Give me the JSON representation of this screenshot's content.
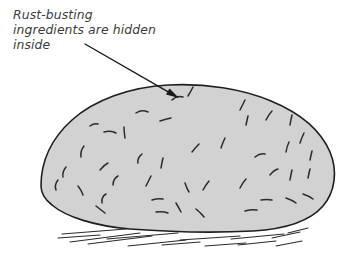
{
  "illustration": {
    "title": "Rock cross-section annotation illustration",
    "background_color": "#ffffff"
  },
  "annotation": {
    "text": "Rust-busting\ningredients are hidden\ninside",
    "lines": [
      "Rust-busting",
      "ingredients are hidden",
      "inside"
    ],
    "color": "#3b3b3b",
    "style": "italic"
  },
  "arrow": {
    "name": "annotation-arrow",
    "start": {
      "x": 85,
      "y": 44
    },
    "end": {
      "x": 179,
      "y": 98
    },
    "color": "#1a1a1a",
    "stroke_width": 1.4,
    "head_length": 13,
    "head_width": 7
  },
  "rock": {
    "name": "rock-boulder",
    "fill_color": "#d2d2d2",
    "stroke_color": "#1f1f1f",
    "stroke_width": 1.6,
    "outline_path": "M 41 186 C 41 160, 52 138, 72 120 C 94 100, 130 87, 168 85 C 205 83, 243 89, 271 101 C 300 113, 321 131, 330 152 C 338 171, 335 192, 323 206 C 310 221, 287 229, 253 231 C 216 233, 170 232, 130 229 C 95 226, 66 217, 52 205 C 43 198, 41 192, 41 186 Z"
  },
  "speckles": {
    "name": "rock-texture-marks",
    "color": "#2b2b2b",
    "stroke_width": 1.5,
    "marks": [
      "M 136 113 q 6 -4 12 -1",
      "M 172 100 q 5 -5 11 -3",
      "M 188 96 q 3 -5 5 -9",
      "M 160 121 q 6 -2 11 -3",
      "M 240 110 q 3 -6 5 -10",
      "M 246 125 q 1 -5 2 -9",
      "M 266 120 q 3 -6 6 -9",
      "M 290 125 q 1 -6 2 -10",
      "M 90 126 q 4 -3 8 -2",
      "M 104 132 q 7 -2 12 1",
      "M 125 138 q -1 -6 -1 -11",
      "M 84 146 q -4 5 -3 11",
      "M 300 143 q 2 -6 4 -10",
      "M 286 152 q 1 -6 3 -10",
      "M 142 154 q -5 4 -4 9",
      "M 192 152 q 4 -5 7 -8",
      "M 221 148 q 2 -6 4 -10",
      "M 255 157 q 5 -4 10 -3",
      "M 310 160 q 1 -5 2 -9",
      "M 161 168 q 1 -6 2 -10",
      "M 66 167 q -4 5 -3 10",
      "M 100 170 q 4 -5 8 -7",
      "M 118 176 q -5 3 -5 9",
      "M 270 175 q 4 -5 8 -6",
      "M 290 180 q 1 -6 2 -10",
      "M 308 178 q 1 -5 2 -9",
      "M 58 180 q -4 5 -2 10",
      "M 78 186 q 4 5 5 9",
      "M 146 186 q 3 -6 5 -10",
      "M 185 183 q 2 6 4 9",
      "M 209 181 q -4 5 -6 9",
      "M 240 188 q 3 -6 6 -9",
      "M 106 194 q -5 3 -4 9",
      "M 96 206 q 5 4 9 7",
      "M 152 200 q 6 -2 11 -1",
      "M 176 203 q 3 5 5 9",
      "M 261 200 q 6 -1 11 0",
      "M 286 198 q 6 2 10 5",
      "M 303 194 q 6 2 10 5",
      "M 156 212 q 7 -1 12 1",
      "M 196 209 q 5 4 8 8",
      "M 245 211 q 7 -2 12 -1"
    ]
  },
  "ground": {
    "name": "ground-hatch-lines",
    "color": "#2b2b2b",
    "stroke_width": 1.1,
    "lines": [
      "M 62 234 L 126 229",
      "M 70 242 L 140 233",
      "M 88 244 L 152 236",
      "M 107 239 L 178 233",
      "M 128 246 L 186 240",
      "M 162 245 L 200 242",
      "M 180 240 L 240 236",
      "M 205 246 L 246 243",
      "M 231 239 L 284 234",
      "M 238 245 L 276 241",
      "M 272 238 L 300 232",
      "M 276 246 L 302 241",
      "M 288 233 L 308 228",
      "M 58 238 L 100 235"
    ]
  }
}
